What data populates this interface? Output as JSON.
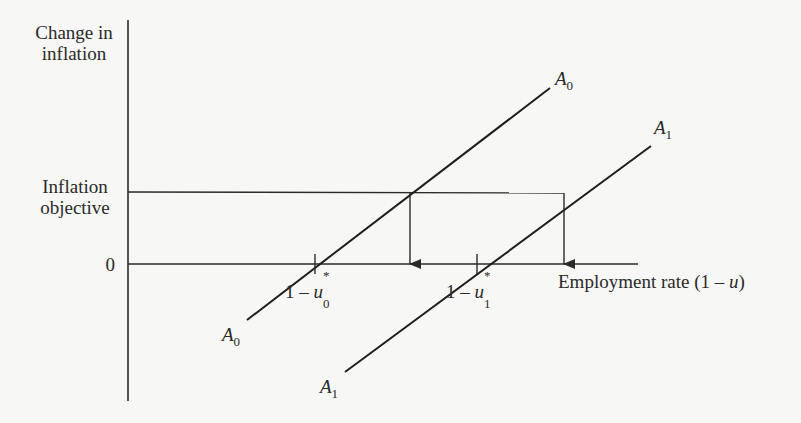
{
  "diagram": {
    "y_axis_label_line1": "Change in",
    "y_axis_label_line2": "inflation",
    "objective_label_line1": "Inflation",
    "objective_label_line2": "objective",
    "zero_label": "0",
    "x_axis_label": "Employment rate (1 – ",
    "x_axis_label_var": "u",
    "x_axis_label_close": ")",
    "tick_u0_prefix": "1 – ",
    "tick_u0_var": "u",
    "tick_u0_sup": "*",
    "tick_u0_sub": "0",
    "tick_u1_prefix": "1 – ",
    "tick_u1_var": "u",
    "tick_u1_sup": "*",
    "tick_u1_sub": "1",
    "curve_a0": {
      "letter": "A",
      "sub": "0"
    },
    "curve_a1": {
      "letter": "A",
      "sub": "1"
    }
  },
  "colors": {
    "line": "#2a2a2a",
    "background": "#f7f7f5"
  }
}
